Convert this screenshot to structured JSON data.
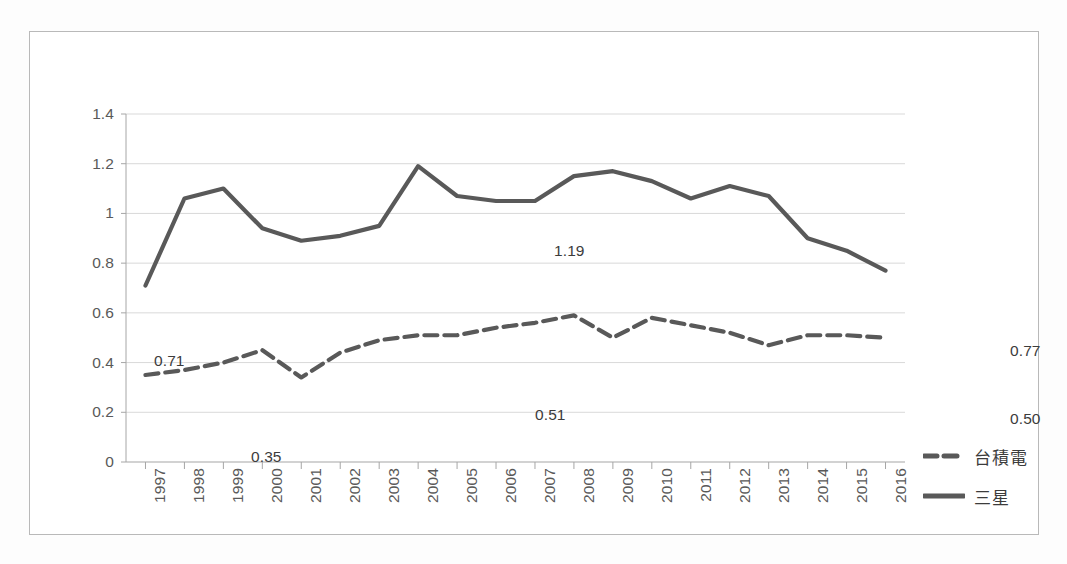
{
  "chart_data": {
    "type": "line",
    "title": "",
    "xlabel": "",
    "ylabel": "",
    "x": [
      "1997",
      "1998",
      "1999",
      "2000",
      "2001",
      "2002",
      "2003",
      "2004",
      "2005",
      "2006",
      "2007",
      "2008",
      "2009",
      "2010",
      "2011",
      "2012",
      "2013",
      "2014",
      "2015",
      "2016"
    ],
    "categories": [
      "1997",
      "1998",
      "1999",
      "2000",
      "2001",
      "2002",
      "2003",
      "2004",
      "2005",
      "2006",
      "2007",
      "2008",
      "2009",
      "2010",
      "2011",
      "2012",
      "2013",
      "2014",
      "2015",
      "2016"
    ],
    "ylim": [
      0,
      1.4
    ],
    "y_ticks": [
      "0",
      "0.2",
      "0.4",
      "0.6",
      "0.8",
      "1",
      "1.2",
      "1.4"
    ],
    "y_tick_values": [
      0,
      0.2,
      0.4,
      0.6,
      0.8,
      1.0,
      1.2,
      1.4
    ],
    "grid": true,
    "legend_position": "right",
    "series": [
      {
        "name": "台積電",
        "style": "dashed",
        "color": "#595959",
        "values": [
          0.35,
          0.37,
          0.4,
          0.45,
          0.34,
          0.44,
          0.49,
          0.51,
          0.51,
          0.54,
          0.56,
          0.59,
          0.5,
          0.58,
          0.55,
          0.52,
          0.47,
          0.51,
          0.51,
          0.5
        ]
      },
      {
        "name": "三星",
        "style": "solid",
        "color": "#595959",
        "values": [
          0.71,
          1.06,
          1.1,
          0.94,
          0.89,
          0.91,
          0.95,
          1.19,
          1.07,
          1.05,
          1.05,
          1.15,
          1.17,
          1.13,
          1.06,
          1.11,
          1.07,
          0.9,
          0.85,
          0.77
        ]
      }
    ],
    "annotations": [
      {
        "text": "0.71",
        "series": "三星",
        "x": "1997",
        "value": 0.71,
        "px": 28,
        "py": 238
      },
      {
        "text": "1.19",
        "series": "三星",
        "x": "2004",
        "value": 1.19,
        "px": 428,
        "py": 128
      },
      {
        "text": "0.77",
        "series": "三星",
        "x": "2016",
        "value": 0.77,
        "px": 884,
        "py": 228
      },
      {
        "text": "0.35",
        "series": "台積電",
        "x": "1997",
        "value": 0.35,
        "px": 125,
        "py": 334
      },
      {
        "text": "0.51",
        "series": "台積電",
        "x": "2005",
        "value": 0.51,
        "px": 409,
        "py": 292
      },
      {
        "text": "0.50",
        "series": "台積電",
        "x": "2016",
        "value": 0.5,
        "px": 884,
        "py": 296
      }
    ]
  },
  "legend": {
    "items": [
      {
        "label": "台積電",
        "style": "dashed"
      },
      {
        "label": "三星",
        "style": "solid"
      }
    ]
  },
  "colors": {
    "line": "#595959",
    "grid": "#d9d9d9",
    "axis": "#a6a6a6",
    "frame": "#b9b9b9",
    "text": "#595959",
    "background": "#ffffff"
  }
}
